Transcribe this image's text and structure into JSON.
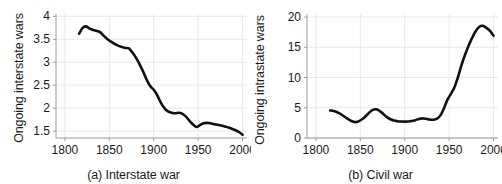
{
  "figure": {
    "background": "#ffffff",
    "line_color": "#111111",
    "grid_color": "#e8e8ea",
    "axis_color": "#9a9a9a"
  },
  "panels": [
    {
      "id": "a",
      "caption": "(a) Interstate war",
      "ylabel": "Ongoing interstate wars",
      "xlabel": ""
    },
    {
      "id": "b",
      "caption": "(b) Civil war",
      "ylabel": "Ongoing intrastate wars",
      "xlabel": ""
    }
  ],
  "chart_data": [
    {
      "type": "line",
      "title": "(a) Interstate war",
      "xlabel": "",
      "ylabel": "Ongoing interstate wars",
      "xlim": [
        1790,
        2005
      ],
      "ylim": [
        1.35,
        4.05
      ],
      "xticks": [
        1800,
        1850,
        1900,
        1950,
        2000
      ],
      "xticklabels": [
        "1800",
        "1850",
        "1900",
        "1950",
        "2000"
      ],
      "yticks": [
        1.5,
        2,
        2.5,
        3,
        3.5,
        4
      ],
      "yticklabels": [
        "1.5",
        "2",
        "2.5",
        "3",
        "3.5",
        "4"
      ],
      "grid": true,
      "legend": false,
      "series": [
        {
          "name": "Ongoing interstate wars",
          "x": [
            1816,
            1820,
            1824,
            1828,
            1832,
            1836,
            1840,
            1844,
            1848,
            1852,
            1856,
            1860,
            1864,
            1868,
            1872,
            1876,
            1880,
            1884,
            1888,
            1892,
            1896,
            1900,
            1904,
            1908,
            1912,
            1916,
            1920,
            1924,
            1928,
            1932,
            1936,
            1940,
            1944,
            1948,
            1952,
            1956,
            1960,
            1964,
            1968,
            1972,
            1976,
            1980,
            1984,
            1988,
            1992,
            1996,
            2000
          ],
          "values": [
            3.62,
            3.75,
            3.78,
            3.73,
            3.7,
            3.68,
            3.65,
            3.57,
            3.5,
            3.45,
            3.4,
            3.36,
            3.33,
            3.31,
            3.3,
            3.21,
            3.1,
            2.96,
            2.8,
            2.62,
            2.48,
            2.4,
            2.28,
            2.12,
            2.0,
            1.93,
            1.9,
            1.89,
            1.9,
            1.88,
            1.82,
            1.73,
            1.65,
            1.59,
            1.63,
            1.67,
            1.68,
            1.67,
            1.65,
            1.64,
            1.62,
            1.6,
            1.58,
            1.55,
            1.52,
            1.48,
            1.42
          ]
        }
      ]
    },
    {
      "type": "line",
      "title": "(b) Civil war",
      "xlabel": "",
      "ylabel": "Ongoing intrastate wars",
      "xlim": [
        1790,
        2005
      ],
      "ylim": [
        0,
        20.5
      ],
      "xticks": [
        1800,
        1850,
        1900,
        1950,
        2000
      ],
      "xticklabels": [
        "1800",
        "1850",
        "1900",
        "1950",
        "2000"
      ],
      "yticks": [
        0,
        5,
        10,
        15,
        20
      ],
      "yticklabels": [
        "0",
        "5",
        "10",
        "15",
        "20"
      ],
      "grid": true,
      "legend": false,
      "series": [
        {
          "name": "Ongoing intrastate wars",
          "x": [
            1816,
            1820,
            1824,
            1828,
            1832,
            1836,
            1840,
            1844,
            1848,
            1852,
            1856,
            1860,
            1864,
            1868,
            1872,
            1876,
            1880,
            1884,
            1888,
            1892,
            1896,
            1900,
            1904,
            1908,
            1912,
            1916,
            1920,
            1924,
            1928,
            1932,
            1936,
            1940,
            1944,
            1948,
            1952,
            1956,
            1960,
            1964,
            1968,
            1972,
            1976,
            1980,
            1984,
            1988,
            1992,
            1996,
            2000
          ],
          "values": [
            4.55,
            4.45,
            4.25,
            3.95,
            3.55,
            3.15,
            2.8,
            2.62,
            2.75,
            3.1,
            3.6,
            4.2,
            4.65,
            4.75,
            4.45,
            3.95,
            3.45,
            3.1,
            2.9,
            2.78,
            2.72,
            2.7,
            2.72,
            2.8,
            2.95,
            3.15,
            3.25,
            3.18,
            3.05,
            3.02,
            3.15,
            3.7,
            4.85,
            6.3,
            7.3,
            8.4,
            10.1,
            12.1,
            13.8,
            15.3,
            16.6,
            17.7,
            18.4,
            18.55,
            18.2,
            17.7,
            16.9
          ]
        }
      ]
    }
  ]
}
